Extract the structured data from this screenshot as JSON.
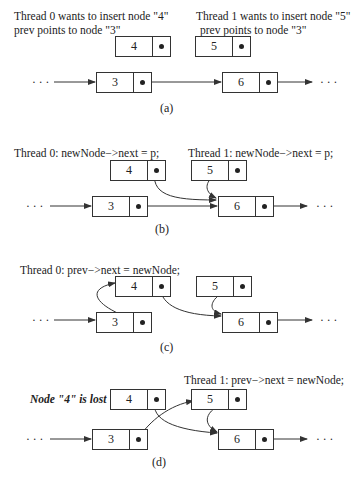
{
  "panels": [
    {
      "id": "a",
      "caption": "(a)",
      "labels": [
        "Thread 0 wants to insert node \"4\"",
        "prev points to node \"3\"",
        "Thread 1 wants to insert node \"5\"",
        "prev points to node \"3\""
      ]
    },
    {
      "id": "b",
      "caption": "(b)",
      "labels": [
        "Thread 0: newNode−>next = p;",
        "Thread 1: newNode−>next = p;"
      ]
    },
    {
      "id": "c",
      "caption": "(c)",
      "labels": [
        "Thread 0: prev−>next = newNode;"
      ]
    },
    {
      "id": "d",
      "caption": "(d)",
      "labels": [
        "Thread 1: prev−>next = newNode;",
        "Node \"4\" is lost"
      ]
    }
  ],
  "nodes": {
    "n3": "3",
    "n4": "4",
    "n5": "5",
    "n6": "6"
  },
  "ellipsis": "· · ·"
}
